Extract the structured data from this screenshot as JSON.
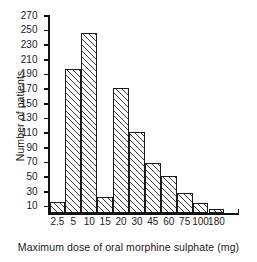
{
  "chart_data": {
    "type": "bar",
    "title": "",
    "xlabel": "Maximum dose of oral morphine sulphate (mg)",
    "ylabel": "Number of patients",
    "categories": [
      "2.5",
      "5",
      "10",
      "15",
      "20",
      "30",
      "45",
      "60",
      "75",
      "100",
      "180"
    ],
    "values": [
      15,
      197,
      245,
      22,
      170,
      110,
      68,
      50,
      27,
      13,
      5
    ],
    "ylim": [
      0,
      270
    ],
    "yticks": [
      10,
      30,
      50,
      70,
      90,
      110,
      130,
      150,
      170,
      190,
      210,
      230,
      250,
      270
    ],
    "ytick_labels": [
      "10",
      "30",
      "50",
      "70",
      "90",
      "110",
      "130",
      "150",
      "170",
      "190",
      "210",
      "230",
      "250",
      "270"
    ],
    "grid": false,
    "legend": null,
    "bar_style": "diagonal-hatch",
    "colors": {
      "bar_fill": "#ffffff",
      "bar_hatch": "#3a3a3a",
      "bar_edge": "#1a1a1a",
      "axis": "#111111",
      "text": "#1a1a1a",
      "background": "#ffffff"
    }
  }
}
